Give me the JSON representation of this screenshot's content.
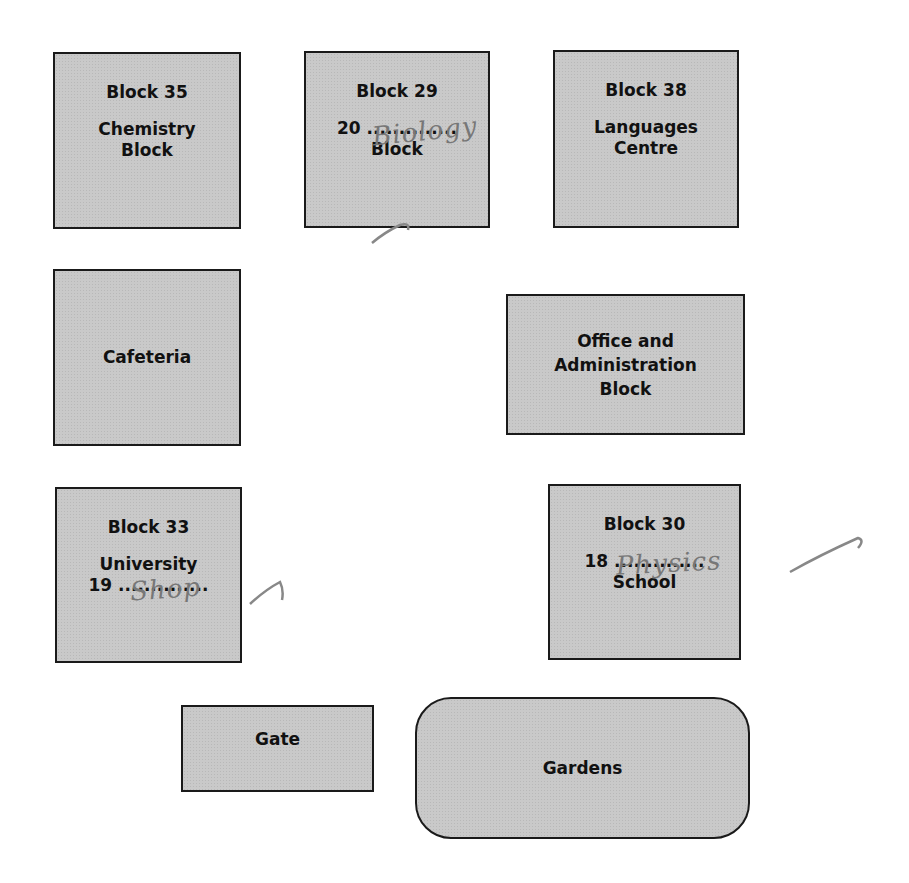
{
  "map": {
    "buildings": [
      {
        "id": "block35",
        "lines": [
          "Block 35",
          "Chemistry",
          "Block"
        ]
      },
      {
        "id": "block29",
        "lines": [
          "Block 29",
          "20 ..............",
          "Block"
        ],
        "handwritten": "Biology"
      },
      {
        "id": "block38",
        "lines": [
          "Block 38",
          "Languages",
          "Centre"
        ]
      },
      {
        "id": "cafeteria",
        "lines": [
          "Cafeteria"
        ]
      },
      {
        "id": "office",
        "lines": [
          "Office and",
          "Administration",
          "Block"
        ]
      },
      {
        "id": "block33",
        "lines": [
          "Block 33",
          "University",
          "19 .............."
        ],
        "handwritten": "Shop"
      },
      {
        "id": "block30",
        "lines": [
          "Block 30",
          "18 ..............",
          "School"
        ],
        "handwritten": "Physics"
      },
      {
        "id": "gate",
        "lines": [
          "Gate"
        ]
      },
      {
        "id": "gardens",
        "lines": [
          "Gardens"
        ]
      }
    ]
  }
}
